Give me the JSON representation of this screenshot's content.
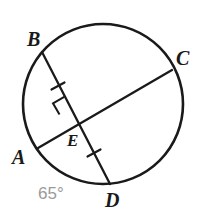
{
  "figure": {
    "kind": "circle-with-two-intersecting-chords",
    "stroke_color": "#1a1a1a",
    "label_color": "#1a1a1a",
    "angle_color": "#9a9a9a",
    "background_color": "#ffffff",
    "circle": {
      "cx": 103,
      "cy": 104,
      "r": 80
    },
    "points": {
      "B": {
        "x": 42,
        "y": 52
      },
      "C": {
        "x": 172,
        "y": 70
      },
      "A": {
        "x": 38,
        "y": 148
      },
      "D": {
        "x": 110,
        "y": 184
      },
      "E": {
        "x": 78,
        "y": 123
      }
    },
    "chords": [
      {
        "name": "chord-BD",
        "from": "B",
        "to": "D"
      },
      {
        "name": "chord-AC",
        "from": "A",
        "to": "C"
      }
    ],
    "markers": {
      "right_angle": {
        "at": "E",
        "label": "right-angle-square"
      },
      "congruent_ticks": [
        {
          "segment": "BE",
          "x": 58,
          "y": 86
        },
        {
          "segment": "ED",
          "x": 94,
          "y": 153
        }
      ]
    }
  },
  "labels": {
    "B": "B",
    "C": "C",
    "A": "A",
    "D": "D",
    "E": "E",
    "angle": "65°"
  }
}
